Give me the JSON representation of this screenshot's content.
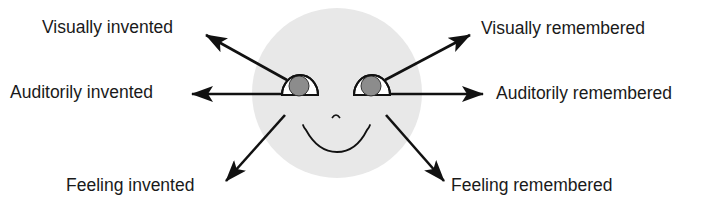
{
  "diagram": {
    "colors": {
      "background": "#ffffff",
      "face": "#e8e8e8",
      "iris": "#8c8c8c",
      "eye_white": "#ffffff",
      "stroke": "#111111",
      "text": "#1a1a1a"
    },
    "face": {
      "cx": 337,
      "cy": 93,
      "r": 85,
      "left_eye": {
        "cx": 300,
        "baseline": 95,
        "rx": 18,
        "iris_cx": 299,
        "iris_cy": 86,
        "iris_r": 10
      },
      "right_eye": {
        "cx": 372,
        "baseline": 95,
        "rx": 18,
        "iris_cx": 371,
        "iris_cy": 86,
        "iris_r": 10
      }
    },
    "labels": {
      "visually_invented": "Visually invented",
      "visually_remembered": "Visually remembered",
      "auditorily_invented": "Auditorily invented",
      "auditorily_remembered": "Auditorily remembered",
      "feeling_invented": "Feeling invented",
      "feeling_remembered": "Feeling remembered"
    },
    "arrows": [
      {
        "name": "visually-invented-arrow",
        "from": [
          287,
          80
        ],
        "to": [
          206,
          35
        ]
      },
      {
        "name": "auditorily-invented-arrow",
        "from": [
          282,
          94
        ],
        "to": [
          192,
          94
        ]
      },
      {
        "name": "feeling-invented-arrow",
        "from": [
          285,
          115
        ],
        "to": [
          226,
          181
        ]
      },
      {
        "name": "visually-remembered-arrow",
        "from": [
          385,
          80
        ],
        "to": [
          470,
          35
        ]
      },
      {
        "name": "auditorily-remembered-arrow",
        "from": [
          390,
          94
        ],
        "to": [
          483,
          94
        ]
      },
      {
        "name": "feeling-remembered-arrow",
        "from": [
          386,
          115
        ],
        "to": [
          444,
          181
        ]
      }
    ]
  }
}
